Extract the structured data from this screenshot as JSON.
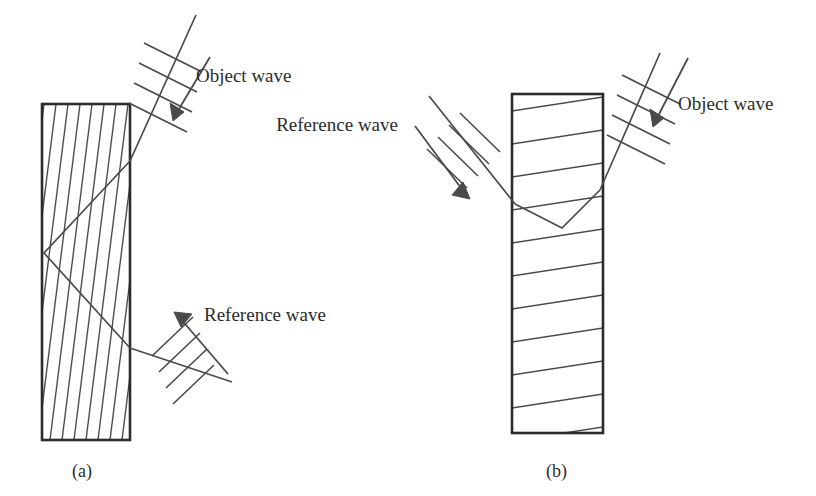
{
  "figure": {
    "domain": "Diagram",
    "background_color": "#ffffff",
    "ink_color": "#3a3a3a",
    "border_color": "#2b2b2b",
    "width": 816,
    "height": 496
  },
  "panels": [
    {
      "id": "a",
      "caption": "(a)",
      "caption_x": 72,
      "caption_y": 477,
      "grating_type": "transmission",
      "crystal": {
        "x": 42,
        "y": 104,
        "width": 88,
        "height": 336,
        "fringe_orientation": "steep-diagonal",
        "fringe_count": 16,
        "fringe_dx": 42
      },
      "labels": [
        {
          "name": "object-wave",
          "text": "Object wave",
          "x": 196,
          "y": 82
        },
        {
          "name": "reference-wave",
          "text": "Reference wave",
          "x": 204,
          "y": 321
        }
      ],
      "beams": [
        {
          "name": "object-wave-beam",
          "role": "object",
          "entry_point": [
            130,
            161
          ],
          "vertex": [
            44,
            253
          ],
          "exit_point": [
            130,
            348
          ]
        }
      ],
      "wave_symbols": [
        {
          "name": "object-wave-symbol",
          "ray": [
            [
              196,
              15
            ],
            [
              124,
              140
            ]
          ],
          "wavefronts": 4,
          "arrow": [
            [
              210,
              57
            ],
            [
              174,
              118
            ]
          ]
        },
        {
          "name": "reference-wave-symbol",
          "ray": [
            [
              232,
              382
            ],
            [
              157,
              324
            ]
          ],
          "wavefronts": 4,
          "arrow": [
            [
              228,
              373
            ],
            [
              172,
              313
            ]
          ]
        }
      ]
    },
    {
      "id": "b",
      "caption": "(b)",
      "caption_x": 546,
      "caption_y": 477,
      "grating_type": "reflection",
      "crystal": {
        "x": 512,
        "y": 94,
        "width": 91,
        "height": 339,
        "fringe_orientation": "near-horizontal",
        "fringe_count": 11,
        "fringe_dy": 33
      },
      "labels": [
        {
          "name": "reference-wave",
          "text": "Reference wave",
          "x": 398,
          "y": 131
        },
        {
          "name": "object-wave",
          "text": "Object wave",
          "x": 678,
          "y": 110
        }
      ],
      "beams": [
        {
          "name": "reference-wave-beam",
          "role": "reference",
          "entry_point": [
            515,
            204
          ],
          "vertex": [
            562,
            228
          ],
          "exit_point": [
            600,
            190
          ]
        }
      ],
      "wave_symbols": [
        {
          "name": "reference-wave-symbol",
          "ray": [
            [
              429,
              96
            ],
            [
              516,
              203
            ]
          ],
          "wavefronts": 4,
          "arrow": [
            [
              416,
              126
            ],
            [
              468,
              198
            ]
          ]
        },
        {
          "name": "object-wave-symbol",
          "ray": [
            [
              660,
              53
            ],
            [
              600,
              190
            ]
          ],
          "wavefronts": 4,
          "arrow": [
            [
              684,
              58
            ],
            [
              654,
              125
            ]
          ]
        }
      ]
    }
  ]
}
